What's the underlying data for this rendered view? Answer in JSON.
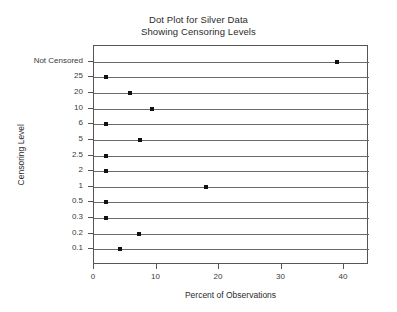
{
  "chart_data": {
    "type": "scatter",
    "title": "Dot Plot for Silver Data",
    "subtitle": "Showing Censoring Levels",
    "xlabel": "Percent of Observations",
    "ylabel": "Censoring Level",
    "xlim": [
      0,
      44
    ],
    "xticks": [
      0,
      10,
      20,
      30,
      40
    ],
    "xtick_labels": [
      "0",
      "10",
      "20",
      "30",
      "40"
    ],
    "grid": false,
    "row_rules": true,
    "categories": [
      "Not Censored",
      "25",
      "20",
      "10",
      "6",
      "5",
      "2.5",
      "2",
      "1",
      "0.5",
      "0.3",
      "0.2",
      "0.1"
    ],
    "values": [
      38.8,
      1.9,
      5.7,
      9.3,
      1.9,
      7.4,
      1.9,
      1.9,
      17.9,
      1.9,
      1.9,
      7.2,
      4.1
    ],
    "points": [
      {
        "category": "Not Censored",
        "value": 38.8
      },
      {
        "category": "25",
        "value": 1.9
      },
      {
        "category": "20",
        "value": 5.7
      },
      {
        "category": "10",
        "value": 9.3
      },
      {
        "category": "6",
        "value": 1.9
      },
      {
        "category": "5",
        "value": 7.4
      },
      {
        "category": "2.5",
        "value": 1.9
      },
      {
        "category": "2",
        "value": 1.9
      },
      {
        "category": "1",
        "value": 17.9
      },
      {
        "category": "0.5",
        "value": 1.9
      },
      {
        "category": "0.3",
        "value": 1.9
      },
      {
        "category": "0.2",
        "value": 7.2
      },
      {
        "category": "0.1",
        "value": 4.1
      }
    ],
    "marker": {
      "shape": "square",
      "color": "#111111",
      "size": 4
    },
    "colors": {
      "line": "#6a6a6a",
      "frame": "#555555",
      "text": "#2b2b2b"
    }
  }
}
